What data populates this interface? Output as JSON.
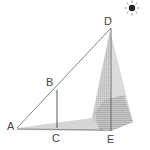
{
  "diagram": {
    "type": "geometry-shadow-measurement",
    "points": {
      "A": {
        "label": "A",
        "x": 17,
        "y": 128
      },
      "B": {
        "label": "B",
        "x": 57,
        "y": 90
      },
      "C": {
        "label": "C",
        "x": 57,
        "y": 128
      },
      "D": {
        "label": "D",
        "x": 111,
        "y": 28
      },
      "E": {
        "label": "E",
        "x": 111,
        "y": 131
      }
    },
    "labels": {
      "A": "A",
      "B": "B",
      "C": "C",
      "D": "D",
      "E": "E"
    },
    "icons": {
      "sun": "sun-icon"
    },
    "colors": {
      "line": "#555555",
      "shadow": "#d6d6d6",
      "pyramid_light": "#d9d9d9",
      "pyramid_dark": "#a8a8a8",
      "sun": "#222222"
    }
  }
}
